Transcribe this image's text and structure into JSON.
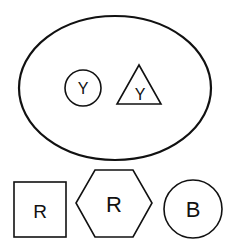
{
  "diagram": {
    "container": {
      "shape": "ellipse",
      "contents": [
        {
          "shape": "circle",
          "label": "Y"
        },
        {
          "shape": "triangle",
          "label": "Y"
        }
      ]
    },
    "bottom_row": [
      {
        "shape": "square",
        "label": "R"
      },
      {
        "shape": "hexagon",
        "label": "R"
      },
      {
        "shape": "circle",
        "label": "B"
      }
    ],
    "stroke_color": "#111111",
    "background": "#ffffff"
  }
}
